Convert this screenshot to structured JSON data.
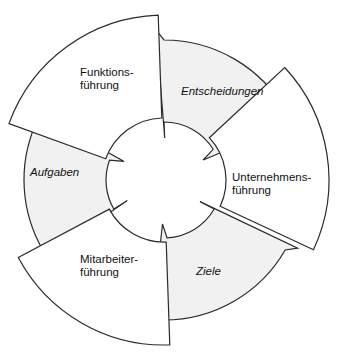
{
  "diagram": {
    "type": "cycle",
    "colors": {
      "stroke": "#2a2a2a",
      "white_fill": "#ffffff",
      "gray_fill": "#f1f1f1",
      "text": "#111111"
    },
    "segments": [
      {
        "id": "funktionsfuehrung",
        "kind": "block",
        "style": "white",
        "italic": false,
        "lines": [
          "Funktions-",
          "führung"
        ]
      },
      {
        "id": "entscheidungen",
        "kind": "arrow",
        "style": "gray",
        "italic": true,
        "lines": [
          "Entscheidungen"
        ]
      },
      {
        "id": "unternehmensfuehrung",
        "kind": "block",
        "style": "white",
        "italic": false,
        "lines": [
          "Unternehmens-",
          "führung"
        ]
      },
      {
        "id": "ziele",
        "kind": "arrow",
        "style": "gray",
        "italic": true,
        "lines": [
          "Ziele"
        ]
      },
      {
        "id": "mitarbeiterfuehrung",
        "kind": "block",
        "style": "white",
        "italic": false,
        "lines": [
          "Mitarbeiter-",
          "führung"
        ]
      },
      {
        "id": "aufgaben",
        "kind": "arrow",
        "style": "gray",
        "italic": true,
        "lines": [
          "Aufgaben"
        ]
      }
    ]
  }
}
